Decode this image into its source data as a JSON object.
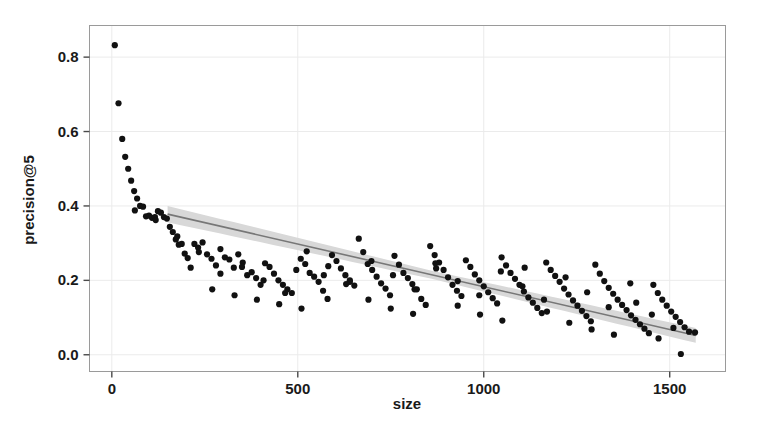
{
  "figure": {
    "background": "#ffffff",
    "panel": {
      "border_color": "#9a9a9a",
      "fill": "#ffffff",
      "grid_color": "#ebebeb"
    }
  },
  "chart_data": {
    "type": "scatter",
    "title": "",
    "xlabel": "size",
    "ylabel": "precision@5",
    "xlim": [
      -60,
      1650
    ],
    "ylim": [
      -0.045,
      0.885
    ],
    "xticks": [
      0,
      500,
      1000,
      1500
    ],
    "xtick_labels": [
      "0",
      "500",
      "1000",
      "1500"
    ],
    "yticks": [
      0.0,
      0.2,
      0.4,
      0.6,
      0.8
    ],
    "ytick_labels": [
      "0.0",
      "0.2",
      "0.4",
      "0.6",
      "0.8"
    ],
    "grid": true,
    "legend": null,
    "point_color": "#111111",
    "point_radius": 3.1,
    "trend": {
      "type": "linear-fit",
      "line_color": "#777777",
      "band_color": "#d8d8d8",
      "x_start": 150,
      "x_end": 1570,
      "y_start": 0.378,
      "y_end": 0.052,
      "band_half_width_start": 0.022,
      "band_half_width_mid": 0.011,
      "band_half_width_end": 0.02
    },
    "x": [
      8,
      18,
      28,
      36,
      44,
      52,
      60,
      68,
      76,
      84,
      92,
      100,
      108,
      116,
      124,
      132,
      140,
      148,
      156,
      164,
      172,
      180,
      188,
      196,
      204,
      212,
      222,
      232,
      244,
      256,
      268,
      280,
      292,
      304,
      316,
      328,
      340,
      352,
      364,
      376,
      388,
      400,
      412,
      424,
      436,
      448,
      460,
      472,
      484,
      496,
      508,
      520,
      532,
      544,
      556,
      568,
      580,
      592,
      604,
      616,
      628,
      640,
      652,
      664,
      676,
      688,
      700,
      712,
      724,
      736,
      748,
      760,
      772,
      784,
      796,
      808,
      820,
      832,
      844,
      856,
      868,
      880,
      892,
      904,
      916,
      928,
      940,
      952,
      964,
      976,
      988,
      1000,
      1012,
      1024,
      1036,
      1048,
      1060,
      1072,
      1084,
      1096,
      1108,
      1120,
      1132,
      1144,
      1156,
      1168,
      1180,
      1192,
      1204,
      1216,
      1228,
      1240,
      1252,
      1264,
      1276,
      1288,
      1300,
      1312,
      1324,
      1336,
      1348,
      1360,
      1372,
      1384,
      1396,
      1408,
      1420,
      1432,
      1444,
      1456,
      1468,
      1480,
      1492,
      1504,
      1516,
      1528,
      1540,
      1552,
      1564,
      1576
    ],
    "y": [
      0.832,
      0.676,
      0.58,
      0.532,
      0.5,
      0.468,
      0.44,
      0.42,
      0.4,
      0.398,
      0.372,
      0.374,
      0.368,
      0.37,
      0.386,
      0.382,
      0.37,
      0.366,
      0.344,
      0.33,
      0.31,
      0.296,
      0.298,
      0.272,
      0.26,
      0.234,
      0.298,
      0.288,
      0.302,
      0.27,
      0.258,
      0.24,
      0.284,
      0.262,
      0.256,
      0.234,
      0.27,
      0.248,
      0.214,
      0.222,
      0.206,
      0.188,
      0.246,
      0.236,
      0.218,
      0.2,
      0.188,
      0.176,
      0.166,
      0.228,
      0.258,
      0.244,
      0.22,
      0.21,
      0.196,
      0.172,
      0.15,
      0.268,
      0.252,
      0.232,
      0.214,
      0.2,
      0.186,
      0.312,
      0.276,
      0.244,
      0.228,
      0.21,
      0.192,
      0.178,
      0.16,
      0.266,
      0.242,
      0.22,
      0.206,
      0.19,
      0.176,
      0.15,
      0.134,
      0.292,
      0.268,
      0.248,
      0.228,
      0.208,
      0.188,
      0.172,
      0.158,
      0.254,
      0.236,
      0.216,
      0.2,
      0.184,
      0.168,
      0.152,
      0.138,
      0.262,
      0.24,
      0.22,
      0.204,
      0.188,
      0.17,
      0.154,
      0.14,
      0.126,
      0.112,
      0.248,
      0.228,
      0.212,
      0.196,
      0.178,
      0.162,
      0.146,
      0.132,
      0.118,
      0.104,
      0.09,
      0.242,
      0.218,
      0.198,
      0.18,
      0.164,
      0.148,
      0.134,
      0.12,
      0.106,
      0.094,
      0.082,
      0.07,
      0.058,
      0.188,
      0.166,
      0.148,
      0.132,
      0.116,
      0.102,
      0.088,
      0.074,
      0.062
    ]
  },
  "scatter_extra": {
    "x": [
      62,
      118,
      176,
      234,
      292,
      350,
      408,
      466,
      524,
      582,
      640,
      698,
      756,
      814,
      872,
      930,
      988,
      1046,
      1104,
      1162,
      1220,
      1278,
      1336,
      1394,
      1452,
      1510,
      1568,
      270,
      330,
      390,
      450,
      510,
      570,
      630,
      690,
      750,
      810,
      870,
      930,
      990,
      1050,
      1110,
      1170,
      1230,
      1290,
      1350,
      1410,
      1470,
      1530
    ],
    "y": [
      0.388,
      0.362,
      0.318,
      0.276,
      0.218,
      0.236,
      0.2,
      0.166,
      0.278,
      0.238,
      0.196,
      0.252,
      0.214,
      0.176,
      0.232,
      0.198,
      0.16,
      0.224,
      0.184,
      0.148,
      0.208,
      0.168,
      0.128,
      0.192,
      0.108,
      0.072,
      0.06,
      0.176,
      0.16,
      0.148,
      0.136,
      0.124,
      0.214,
      0.19,
      0.148,
      0.124,
      0.11,
      0.246,
      0.132,
      0.108,
      0.092,
      0.234,
      0.116,
      0.086,
      0.068,
      0.054,
      0.14,
      0.044,
      0.002
    ]
  }
}
